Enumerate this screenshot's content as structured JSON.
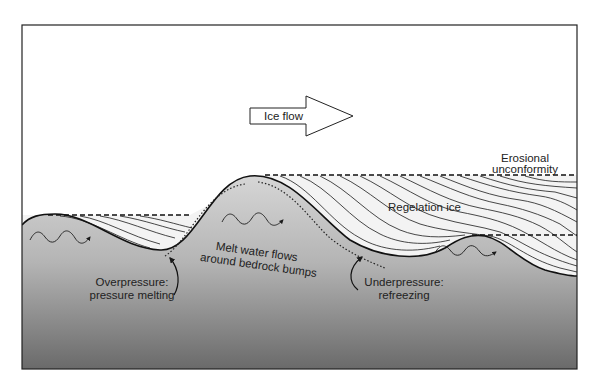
{
  "diagram": {
    "labels": {
      "ice_flow": "Ice flow",
      "erosional_1": "Erosional",
      "erosional_2": "unconformity",
      "regelation": "Regelation ice",
      "melt_1": "Melt water flows",
      "melt_2": "around bedrock bumps",
      "over_1": "Overpressure:",
      "over_2": "pressure melting",
      "under_1": "Underpressure:",
      "under_2": "refreezing"
    },
    "colors": {
      "frame": "#222222",
      "bedrock_top": "#d8d8d8",
      "bedrock_bottom": "#6e6e6e",
      "ice_fill": "#f2f2f2",
      "line": "#1a1a1a"
    }
  }
}
